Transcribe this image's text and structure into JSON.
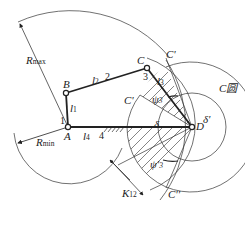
{
  "diagram": {
    "points": {
      "A": {
        "label": "A"
      },
      "B": {
        "label": "B"
      },
      "C": {
        "label": "C"
      },
      "D": {
        "label": "D"
      },
      "C_top": {
        "label": "C'"
      },
      "C_prime": {
        "label": "C'"
      },
      "C_double": {
        "label": "C''"
      }
    },
    "links": {
      "l1": {
        "label": "l",
        "sub": "1",
        "number": "1"
      },
      "l2": {
        "label": "l",
        "sub": "2",
        "number": "2"
      },
      "l3": {
        "label": "l",
        "sub": "3",
        "number": "3"
      },
      "l4": {
        "label": "l",
        "sub": "4",
        "number": "4"
      }
    },
    "radii": {
      "rmax": {
        "label": "R",
        "sub": "max"
      },
      "rmin": {
        "label": "R",
        "sub": "min"
      }
    },
    "angles": {
      "psi3": {
        "label": "ψ",
        "sub": "3"
      },
      "psi3_prime": {
        "label": "ψ'",
        "sub": "3"
      },
      "delta": {
        "label": "δ"
      },
      "delta_prime": {
        "label": "δ'"
      }
    },
    "dimension": {
      "label": "K",
      "sub": "12"
    },
    "circle_label": "C圆",
    "colors": {
      "line": "#222222",
      "background": "#ffffff"
    }
  }
}
